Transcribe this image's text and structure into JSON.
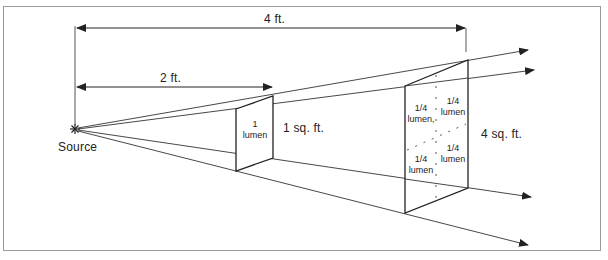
{
  "diagram": {
    "source_label": "Source",
    "distances": {
      "far": "4 ft.",
      "near": "2 ft."
    },
    "near_surface": {
      "flux_value": "1",
      "flux_unit": "lumen",
      "area": "1 sq. ft."
    },
    "far_surface": {
      "area": "4 sq. ft.",
      "quadrants": [
        {
          "value": "1/4",
          "unit": "lumen,"
        },
        {
          "value": "1/4",
          "unit": "lumen"
        },
        {
          "value": "1/4",
          "unit": "lumen"
        },
        {
          "value": "1/4",
          "unit": "lumen"
        }
      ]
    },
    "colors": {
      "line": "#222222",
      "frame": "#9a9a9a",
      "text": "#222222"
    }
  }
}
